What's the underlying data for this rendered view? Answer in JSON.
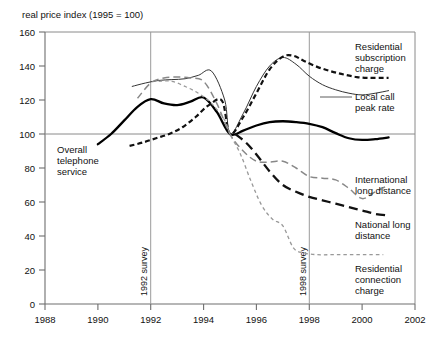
{
  "chart_data": {
    "type": "line",
    "title": "real price index (1995 = 100)",
    "xlabel": "",
    "ylabel": "real price index (1995 = 100)",
    "xlim": [
      1988,
      2002
    ],
    "ylim": [
      0,
      160
    ],
    "xticks": [
      1988,
      1990,
      1992,
      1994,
      1996,
      1998,
      2000,
      2002
    ],
    "xtick_labels": [
      "1988",
      "1990",
      "1992",
      "1994",
      "1996",
      "1998",
      "2000",
      "2002"
    ],
    "yticks": [
      0,
      20,
      40,
      60,
      80,
      100,
      120,
      140,
      160
    ],
    "ytick_labels": [
      "0",
      "20",
      "40",
      "60",
      "80",
      "100",
      "120",
      "140",
      "160"
    ],
    "grid": "horizontal reference line at 100 only",
    "legend_position": "inline labels at right of plot",
    "annotations": [
      {
        "name": "survey-1992",
        "text": "1992 survey",
        "x": 1992,
        "orientation": "vertical"
      },
      {
        "name": "survey-1998",
        "text": "1998 survey",
        "x": 1998,
        "orientation": "vertical"
      }
    ],
    "series": [
      {
        "name": "Overall telephone service",
        "label": "Overall telephone service",
        "style": "solid-thick",
        "color": "#000000",
        "label_position": "left-inside",
        "x": [
          1990.0,
          1990.5,
          1991.0,
          1991.5,
          1992.0,
          1992.5,
          1993.0,
          1993.5,
          1994.0,
          1994.5,
          1995.0,
          1995.5,
          1996.0,
          1996.5,
          1997.0,
          1997.5,
          1998.0,
          1998.5,
          1999.0,
          1999.5,
          2000.0,
          2000.5,
          2001.0
        ],
        "y": [
          94,
          100,
          108,
          116,
          120.5,
          118,
          117,
          119,
          121.5,
          113,
          100,
          102,
          105,
          107,
          107.5,
          107,
          106,
          104,
          100.5,
          97.5,
          96.5,
          97,
          98
        ]
      },
      {
        "name": "Local call peak rate",
        "label": "Local call peak rate",
        "style": "solid-thin",
        "color": "#333333",
        "label_position": "right",
        "x": [
          1991.3,
          1991.8,
          1992.3,
          1992.8,
          1993.3,
          1993.8,
          1994.3,
          1994.8,
          1995.0,
          1995.5,
          1996.0,
          1996.5,
          1997.0,
          1997.5,
          1998.0,
          1998.5,
          1999.0,
          1999.5,
          2000.0,
          2000.5,
          2001.0
        ],
        "y": [
          128,
          130,
          131.5,
          132,
          132.5,
          134.5,
          137,
          120,
          100,
          112,
          128,
          140,
          145,
          141,
          134,
          129,
          126,
          124,
          123,
          124,
          125.5
        ]
      },
      {
        "name": "Residential subscription charge",
        "label": "Residential subscription charge",
        "style": "dashed-thick",
        "color": "#111111",
        "label_position": "right",
        "x": [
          1991.2,
          1991.7,
          1992.2,
          1992.7,
          1993.2,
          1993.7,
          1994.2,
          1994.7,
          1995.0,
          1995.5,
          1996.0,
          1996.5,
          1997.0,
          1997.4,
          1997.8,
          1998.3,
          1998.8,
          1999.3,
          1999.8,
          2000.3,
          2000.8,
          2001.0
        ],
        "y": [
          93,
          95,
          97.5,
          100,
          104,
          110,
          117,
          119.5,
          100,
          110,
          124,
          138,
          145.5,
          146,
          143,
          139.5,
          137,
          135,
          133.5,
          133,
          133,
          133
        ]
      },
      {
        "name": "International long distance",
        "label": "International long distance",
        "style": "dashed-medium-gray",
        "color": "#888888",
        "label_position": "right",
        "x": [
          1991.5,
          1992.0,
          1992.5,
          1993.0,
          1993.5,
          1994.0,
          1994.5,
          1995.0,
          1995.5,
          1996.0,
          1996.5,
          1997.0,
          1997.5,
          1998.0,
          1998.5,
          1999.0,
          1999.5,
          2000.0,
          2000.5,
          2001.0
        ],
        "y": [
          121,
          130,
          133,
          133.5,
          133,
          131,
          118,
          100,
          90,
          84,
          83.5,
          84,
          80,
          75,
          74,
          73,
          68,
          62,
          66,
          70
        ]
      },
      {
        "name": "National long distance",
        "label": "National long distance",
        "style": "dashed-long-black",
        "color": "#111111",
        "label_position": "right",
        "x": [
          1995.2,
          1995.6,
          1996.0,
          1996.5,
          1997.0,
          1997.5,
          1998.0,
          1998.5,
          1999.0,
          1999.5,
          2000.0,
          2000.5,
          2001.0
        ],
        "y": [
          100,
          95,
          88,
          78,
          70,
          66,
          63,
          61,
          59,
          57,
          55,
          53,
          52
        ]
      },
      {
        "name": "Residential connection charge",
        "label": "Residential connection charge",
        "style": "dotted-gray",
        "color": "#999999",
        "label_position": "right",
        "x": [
          1992.3,
          1992.8,
          1993.3,
          1993.8,
          1994.3,
          1994.8,
          1995.0,
          1995.4,
          1995.8,
          1996.2,
          1996.6,
          1997.0,
          1997.4,
          1997.8,
          1998.3,
          1998.8,
          1999.3,
          1999.8,
          2000.3,
          2000.8
        ],
        "y": [
          131,
          131,
          128,
          124,
          118,
          108,
          100,
          88,
          72,
          58,
          50,
          46,
          33,
          30,
          29,
          29,
          29,
          29,
          29,
          29
        ]
      }
    ]
  },
  "labels": {
    "overall": "Overall\ntelephone\nservice",
    "overall_line1": "Overall",
    "overall_line2": "telephone",
    "overall_line3": "service",
    "residential_subscription_l1": "Residential",
    "residential_subscription_l2": "subscription",
    "residential_subscription_l3": "charge",
    "local_call_l1": "Local call",
    "local_call_l2": "peak rate",
    "international_l1": "International",
    "international_l2": "long distance",
    "national_l1": "National long",
    "national_l2": "distance",
    "residential_connection_l1": "Residential",
    "residential_connection_l2": "connection",
    "residential_connection_l3": "charge",
    "survey_1992": "1992 survey",
    "survey_1998": "1998 survey"
  },
  "colors": {
    "background": "#ffffff",
    "frame": "#8a8a8a",
    "text": "#000000",
    "gray_series": "#8d8d8d"
  }
}
